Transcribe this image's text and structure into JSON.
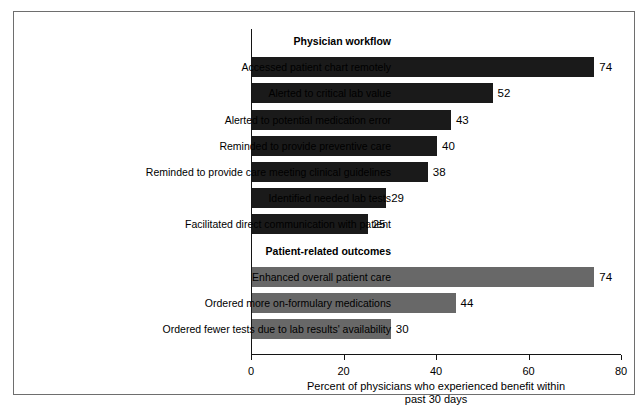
{
  "chart_data": {
    "type": "bar",
    "orientation": "horizontal",
    "title": "",
    "xlabel": "Percent of physicians who experienced benefit within past 30 days",
    "xlabel_line1": "Percent of physicians who experienced benefit within",
    "xlabel_line2": "past 30 days",
    "ylabel": "",
    "xlim": [
      0,
      80
    ],
    "xticks": [
      0,
      20,
      40,
      60,
      80
    ],
    "xticklabels": [
      "0",
      "20",
      "40",
      "60",
      "80"
    ],
    "grid": false,
    "legend": false,
    "colors": {
      "physician_workflow_bar": "#1a1a1a",
      "patient_related_bar": "#686868",
      "axis": "#141414",
      "border": "#6e6e6e",
      "background": "#ffffff"
    },
    "groups": [
      {
        "header": "Physician workflow",
        "color": "#1a1a1a",
        "categories": [
          "Accessed patient chart remotely",
          "Alerted to critical lab value",
          "Alerted to potential medication error",
          "Reminded to provide preventive care",
          "Reminded to provide care meeting clinical guidelines",
          "Identified needed lab tests",
          "Facilitated direct communication with patient"
        ],
        "values": [
          74,
          52,
          43,
          40,
          38,
          29,
          25
        ]
      },
      {
        "header": "Patient-related outcomes",
        "color": "#686868",
        "categories": [
          "Enhanced overall patient care",
          "Ordered more on-formulary medications",
          "Ordered fewer tests due to lab results' availability"
        ],
        "values": [
          74,
          44,
          30
        ]
      }
    ],
    "categories": [
      "Accessed patient chart remotely",
      "Alerted to critical lab value",
      "Alerted to potential medication error",
      "Reminded to provide preventive care",
      "Reminded to provide care meeting clinical guidelines",
      "Identified needed lab tests",
      "Facilitated direct communication with patient",
      "Enhanced overall patient care",
      "Ordered more on-formulary medications",
      "Ordered fewer tests due to lab results' availability"
    ],
    "values": [
      74,
      52,
      43,
      40,
      38,
      29,
      25,
      74,
      44,
      30
    ]
  },
  "rows": [
    {
      "kind": "header",
      "label": "Physician workflow"
    },
    {
      "kind": "bar",
      "label": "Accessed patient chart remotely",
      "value": 74,
      "value_text": "74",
      "style": "dark"
    },
    {
      "kind": "bar",
      "label": "Alerted to critical lab value",
      "value": 52,
      "value_text": "52",
      "style": "dark"
    },
    {
      "kind": "bar",
      "label": "Alerted to potential medication error",
      "value": 43,
      "value_text": "43",
      "style": "dark"
    },
    {
      "kind": "bar",
      "label": "Reminded to provide preventive care",
      "value": 40,
      "value_text": "40",
      "style": "dark"
    },
    {
      "kind": "bar",
      "label": "Reminded to provide care meeting clinical guidelines",
      "value": 38,
      "value_text": "38",
      "style": "dark"
    },
    {
      "kind": "bar",
      "label": "Identified needed lab tests",
      "value": 29,
      "value_text": "29",
      "style": "dark"
    },
    {
      "kind": "bar",
      "label": "Facilitated direct communication with patient",
      "value": 25,
      "value_text": "25",
      "style": "dark"
    },
    {
      "kind": "header",
      "label": "Patient-related outcomes"
    },
    {
      "kind": "bar",
      "label": "Enhanced overall patient care",
      "value": 74,
      "value_text": "74",
      "style": "gray"
    },
    {
      "kind": "bar",
      "label": "Ordered more on-formulary medications",
      "value": 44,
      "value_text": "44",
      "style": "gray"
    },
    {
      "kind": "bar",
      "label": "Ordered fewer tests due to lab results' availability",
      "value": 30,
      "value_text": "30",
      "style": "gray"
    }
  ],
  "axis": {
    "ticks": [
      "0",
      "20",
      "40",
      "60",
      "80"
    ],
    "title_line1": "Percent of physicians who experienced benefit within",
    "title_line2": "past 30 days"
  }
}
